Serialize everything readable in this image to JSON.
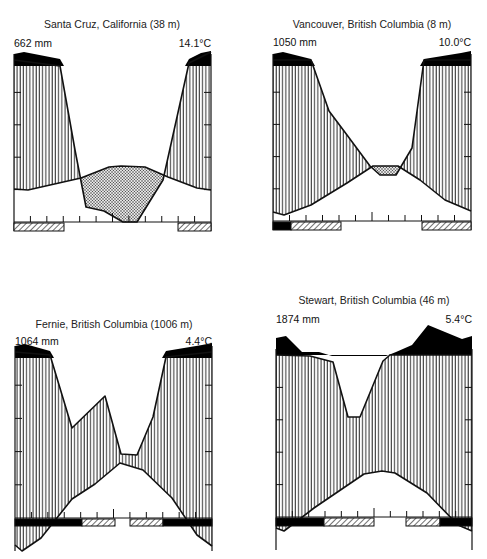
{
  "figure": {
    "colors": {
      "line": "#111111",
      "humid": "#111111",
      "perhumid": "#000000",
      "dry": "#cccccc",
      "frost": "#000000"
    }
  },
  "chart_data": [
    {
      "type": "climate-diagram",
      "title": "Santa Cruz, California (38 m)",
      "annual_precipitation_label": "662 mm",
      "mean_temperature_label": "14.1°C",
      "months": [
        "J",
        "F",
        "M",
        "A",
        "M",
        "J",
        "J",
        "A",
        "S",
        "O",
        "N",
        "D"
      ],
      "precip_curve_px": [
        [
          14,
          60
        ],
        [
          60,
          66
        ],
        [
          75,
          150
        ],
        [
          86,
          207
        ],
        [
          104,
          211
        ],
        [
          123,
          222
        ],
        [
          137,
          222
        ],
        [
          163,
          180
        ],
        [
          189,
          63
        ],
        [
          211,
          52
        ]
      ],
      "temp_curve_px": [
        [
          14,
          189
        ],
        [
          28,
          190
        ],
        [
          81,
          178
        ],
        [
          109,
          167
        ],
        [
          121,
          166
        ],
        [
          145,
          167
        ],
        [
          168,
          177
        ],
        [
          197,
          188
        ],
        [
          211,
          190
        ]
      ],
      "frame": {
        "x0": 14,
        "x1": 211,
        "top": 60,
        "baseline": 222,
        "bar_bottom": 231
      },
      "period_bars": [
        {
          "kind": "hatched",
          "from": 14,
          "to": 64
        },
        {
          "kind": "hatched",
          "from": 178,
          "to": 211
        }
      ],
      "tick_count": 12
    },
    {
      "type": "climate-diagram",
      "title": "Vancouver, British Columbia (8 m)",
      "annual_precipitation_label": "1050 mm",
      "mean_temperature_label": "10.0°C",
      "months": [
        "J",
        "F",
        "M",
        "A",
        "M",
        "J",
        "J",
        "A",
        "S",
        "O",
        "N",
        "D"
      ],
      "precip_curve_px": [
        [
          273,
          60
        ],
        [
          311,
          60
        ],
        [
          329,
          111
        ],
        [
          347,
          135
        ],
        [
          370,
          166
        ],
        [
          380,
          175
        ],
        [
          396,
          175
        ],
        [
          412,
          148
        ],
        [
          424,
          60
        ],
        [
          471,
          60
        ]
      ],
      "temp_curve_px": [
        [
          273,
          212
        ],
        [
          284,
          215
        ],
        [
          311,
          205
        ],
        [
          347,
          183
        ],
        [
          373,
          166
        ],
        [
          398,
          166
        ],
        [
          420,
          180
        ],
        [
          445,
          200
        ],
        [
          471,
          211
        ]
      ],
      "frame": {
        "x0": 273,
        "x1": 471,
        "top": 60,
        "baseline": 221,
        "bar_bottom": 230
      },
      "period_bars": [
        {
          "kind": "solid",
          "from": 273,
          "to": 291
        },
        {
          "kind": "hatched",
          "from": 291,
          "to": 341
        },
        {
          "kind": "hatched",
          "from": 422,
          "to": 471
        }
      ],
      "tick_count": 12
    },
    {
      "type": "climate-diagram",
      "title": "Fernie, British Columbia (1006 m)",
      "annual_precipitation_label": "1064 mm",
      "mean_temperature_label": "4.4°C",
      "months": [
        "J",
        "F",
        "M",
        "A",
        "M",
        "J",
        "J",
        "A",
        "S",
        "O",
        "N",
        "D"
      ],
      "precip_curve_px": [
        [
          15,
          352
        ],
        [
          50,
          355
        ],
        [
          72,
          428
        ],
        [
          105,
          396
        ],
        [
          121,
          454
        ],
        [
          137,
          455
        ],
        [
          153,
          417
        ],
        [
          166,
          357
        ],
        [
          212,
          352
        ]
      ],
      "temp_curve_px": [
        [
          15,
          545
        ],
        [
          22,
          551
        ],
        [
          41,
          538
        ],
        [
          72,
          499
        ],
        [
          95,
          484
        ],
        [
          120,
          463
        ],
        [
          143,
          470
        ],
        [
          172,
          498
        ],
        [
          197,
          535
        ],
        [
          212,
          546
        ]
      ],
      "frame": {
        "x0": 15,
        "x1": 212,
        "top": 352,
        "baseline": 518,
        "bar_bottom": 526,
        "bottom": 551
      },
      "period_bars": [
        {
          "kind": "solid",
          "from": 15,
          "to": 82
        },
        {
          "kind": "hatched",
          "from": 82,
          "to": 115
        },
        {
          "kind": "hatched",
          "from": 130,
          "to": 163
        },
        {
          "kind": "solid",
          "from": 163,
          "to": 212
        }
      ],
      "tick_count": 12
    },
    {
      "type": "climate-diagram",
      "title": "Stewart, British Columbia (46 m)",
      "annual_precipitation_label": "1874 mm",
      "mean_temperature_label": "5.4°C",
      "months": [
        "J",
        "F",
        "M",
        "A",
        "M",
        "J",
        "J",
        "A",
        "S",
        "O",
        "N",
        "D"
      ],
      "precip_curve_px": [
        [
          276,
          355
        ],
        [
          310,
          356
        ],
        [
          333,
          362
        ],
        [
          348,
          417
        ],
        [
          360,
          417
        ],
        [
          383,
          361
        ],
        [
          390,
          355
        ],
        [
          472,
          355
        ]
      ],
      "temp_curve_px": [
        [
          276,
          528
        ],
        [
          284,
          531
        ],
        [
          314,
          508
        ],
        [
          364,
          474
        ],
        [
          382,
          471
        ],
        [
          395,
          473
        ],
        [
          427,
          493
        ],
        [
          458,
          525
        ],
        [
          472,
          531
        ]
      ],
      "frame": {
        "x0": 276,
        "x1": 472,
        "top": 355,
        "baseline": 517,
        "bar_bottom": 526,
        "bottom": 550
      },
      "perhumid_top_px": [
        [
          276,
          338
        ],
        [
          286,
          336
        ],
        [
          302,
          352
        ],
        [
          319,
          352
        ],
        [
          332,
          356
        ],
        [
          386,
          356
        ],
        [
          396,
          352
        ],
        [
          412,
          345
        ],
        [
          428,
          325
        ],
        [
          462,
          339
        ],
        [
          472,
          336
        ]
      ],
      "period_bars": [
        {
          "kind": "solid",
          "from": 276,
          "to": 324
        },
        {
          "kind": "hatched",
          "from": 324,
          "to": 374
        },
        {
          "kind": "hatched",
          "from": 406,
          "to": 440
        },
        {
          "kind": "solid",
          "from": 440,
          "to": 472
        }
      ],
      "tick_count": 12
    }
  ]
}
